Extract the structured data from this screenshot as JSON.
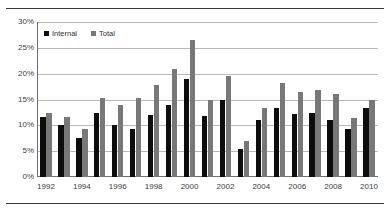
{
  "figure": {
    "background_color": "#ffffff",
    "rule_color": "#3a3a3a",
    "has_top_rule": true,
    "has_bottom_rule": true
  },
  "legend": {
    "position": "top-left-inside",
    "entries": [
      {
        "label": "Internal",
        "color": "#0d0d0d",
        "marker": "square-swatch"
      },
      {
        "label": "Total",
        "color": "#787878",
        "marker": "square-swatch"
      }
    ]
  },
  "axes": {
    "y_ticks": [
      "0%",
      "5%",
      "10%",
      "15%",
      "20%",
      "25%",
      "30%"
    ],
    "y_tick_values": [
      0,
      5,
      10,
      15,
      20,
      25,
      30
    ],
    "x_ticks_visible": [
      "1992",
      "1994",
      "1996",
      "1998",
      "2000",
      "2002",
      "2004",
      "2006",
      "2008",
      "2010"
    ],
    "gridlines": "horizontal",
    "grid_color": "#b9b9b9",
    "axis_color": "#6f6f6f"
  },
  "chart_data": {
    "type": "bar",
    "title": "",
    "subtitle": "",
    "xlabel": "",
    "ylabel": "",
    "ylim": [
      0,
      30
    ],
    "ytick_step": 5,
    "ytick_format": "percent",
    "grid": true,
    "legend_position": "upper left (inside plot)",
    "categories": [
      "1992",
      "1993",
      "1994",
      "1995",
      "1996",
      "1997",
      "1998",
      "1999",
      "2000",
      "2001",
      "2002",
      "2003",
      "2004",
      "2005",
      "2006",
      "2007",
      "2008",
      "2009",
      "2010"
    ],
    "series": [
      {
        "name": "Internal",
        "color": "#0d0d0d",
        "values": [
          11.7,
          10.0,
          7.6,
          12.4,
          10.1,
          9.2,
          12.0,
          14.0,
          19.0,
          11.8,
          15.0,
          5.5,
          11.0,
          13.4,
          12.2,
          12.3,
          11.0,
          9.2,
          13.3
        ]
      },
      {
        "name": "Total",
        "color": "#787878",
        "values": [
          12.3,
          11.7,
          9.2,
          15.2,
          14.0,
          15.2,
          17.8,
          21.0,
          26.5,
          15.0,
          19.5,
          7.0,
          13.4,
          18.2,
          16.4,
          16.8,
          16.0,
          11.5,
          14.9
        ]
      }
    ]
  }
}
